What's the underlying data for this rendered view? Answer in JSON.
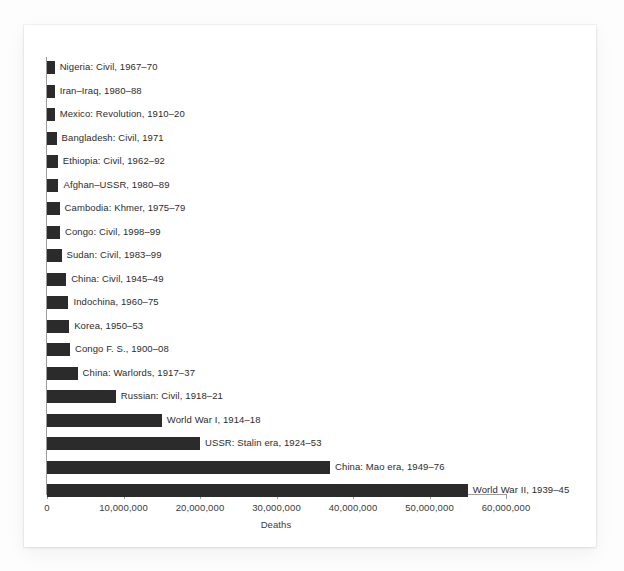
{
  "chart_data": {
    "type": "bar",
    "orientation": "horizontal",
    "title": "",
    "xlabel": "Deaths",
    "ylabel": "",
    "xlim": [
      0,
      60000000
    ],
    "xticks": [
      0,
      10000000,
      20000000,
      30000000,
      40000000,
      50000000,
      60000000
    ],
    "xtick_labels": [
      "0",
      "10,000,000",
      "20,000,000",
      "30,000,000",
      "40,000,000",
      "50,000,000",
      "60,000,000"
    ],
    "grid": false,
    "legend": null,
    "bar_color": "#2b2b2b",
    "categories": [
      "Nigeria: Civil, 1967–70",
      "Iran–Iraq, 1980–88",
      "Mexico: Revolution, 1910–20",
      "Bangladesh: Civil, 1971",
      "Ethiopia: Civil, 1962–92",
      "Afghan–USSR, 1980–89",
      "Cambodia: Khmer, 1975–79",
      "Congo: Civil, 1998–99",
      "Sudan: Civil, 1983–99",
      "China: Civil, 1945–49",
      "Indochina, 1960–75",
      "Korea, 1950–53",
      "Congo F. S., 1900–08",
      "China: Warlords, 1917–37",
      "Russian: Civil, 1918–21",
      "World War I, 1914–18",
      "USSR: Stalin era, 1924–53",
      "China: Mao era, 1949–76",
      "World War II, 1939–45"
    ],
    "values": [
      1000000,
      1000000,
      1000000,
      1250000,
      1400000,
      1500000,
      1650000,
      1700000,
      1900000,
      2500000,
      2800000,
      2900000,
      3000000,
      4000000,
      9000000,
      15000000,
      20000000,
      37000000,
      55000000
    ]
  },
  "axis": {
    "x_title": "Deaths"
  }
}
